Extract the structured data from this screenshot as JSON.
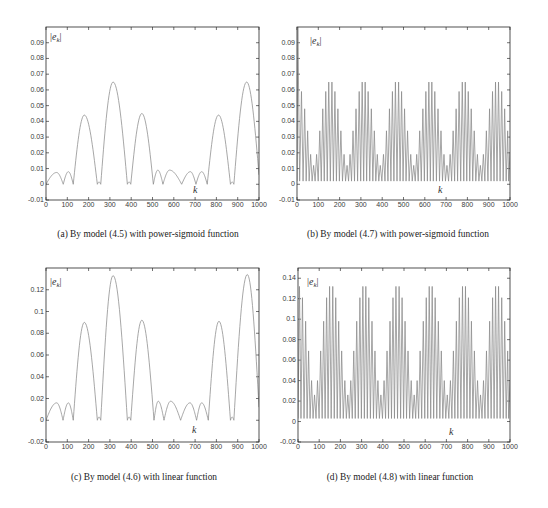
{
  "chart_data": [
    {
      "panel": "a",
      "type": "line",
      "title": "(a) By model (4.5) with power-sigmoid function",
      "xlabel": "k",
      "ylabel": "|e_k|",
      "ylabel_display": {
        "pre": "|",
        "base": "e",
        "sub": "k",
        "post": "|"
      },
      "xlim": [
        0,
        1000
      ],
      "ylim": [
        -0.01,
        0.1
      ],
      "xticks": [
        0,
        100,
        200,
        300,
        400,
        500,
        600,
        700,
        800,
        900,
        1000
      ],
      "xtick_labels": [
        "0",
        "100",
        "200",
        "300",
        "400",
        "500",
        "600",
        "700",
        "800",
        "900",
        "1000"
      ],
      "yticks": [
        -0.01,
        0,
        0.01,
        0.02,
        0.03,
        0.04,
        0.05,
        0.06,
        0.07,
        0.08,
        0.09
      ],
      "ytick_labels": [
        "-0.01",
        "0",
        "0.01",
        "0.02",
        "0.03",
        "0.04",
        "0.05",
        "0.06",
        "0.07",
        "0.08",
        "0.09"
      ],
      "grid": false,
      "legend": null,
      "line_color": "#8a8a8a",
      "render": "arcs",
      "series": [
        {
          "name": "|e_k|",
          "x": [
            0,
            50,
            81,
            105,
            128,
            180,
            241,
            249,
            257,
            315,
            382,
            390,
            398,
            450,
            504,
            525,
            549,
            580,
            637,
            678,
            704,
            731,
            757,
            810,
            866,
            874,
            882,
            942,
            1000
          ],
          "y": [
            0,
            0.0075,
            0,
            0.008,
            0,
            0.044,
            0,
            0.0015,
            0,
            0.065,
            0,
            0.0015,
            0,
            0.045,
            0,
            0.009,
            0,
            0.009,
            0,
            0.008,
            0,
            0.008,
            0,
            0.044,
            0,
            0.0015,
            0,
            0.065,
            0.006
          ]
        }
      ]
    },
    {
      "panel": "b",
      "type": "line",
      "title": "(b) By model (4.7) with power-sigmoid function",
      "xlabel": "k",
      "ylabel": "|e_k|",
      "ylabel_display": {
        "pre": "|",
        "base": "e",
        "sub": "k",
        "post": "|"
      },
      "xlim": [
        0,
        1000
      ],
      "ylim": [
        -0.01,
        0.1
      ],
      "xticks": [
        0,
        100,
        200,
        300,
        400,
        500,
        600,
        700,
        800,
        900,
        1000
      ],
      "xtick_labels": [
        "0",
        "100",
        "200",
        "300",
        "400",
        "500",
        "600",
        "700",
        "800",
        "900",
        "1000"
      ],
      "yticks": [
        -0.01,
        0,
        0.01,
        0.02,
        0.03,
        0.04,
        0.05,
        0.06,
        0.07,
        0.08,
        0.09
      ],
      "ytick_labels": [
        "-0.01",
        "0",
        "0.01",
        "0.02",
        "0.03",
        "0.04",
        "0.05",
        "0.06",
        "0.07",
        "0.08",
        "0.09"
      ],
      "grid": false,
      "legend": null,
      "line_color": "#8a8a8a",
      "render": "spikes",
      "series": [
        {
          "name": "|e_k| oscillation peaks",
          "trough": 0.002,
          "end_value": 0.02,
          "x": [
            4,
            21,
            36,
            50,
            64,
            78,
            92,
            107,
            121,
            135,
            149,
            164,
            178,
            192,
            206,
            221,
            235,
            249,
            263,
            277,
            292,
            306,
            320,
            334,
            349,
            363,
            377,
            391,
            406,
            420,
            434,
            448,
            462,
            477,
            491,
            505,
            519,
            534,
            548,
            562,
            576,
            591,
            605,
            619,
            633,
            647,
            662,
            676,
            690,
            704,
            719,
            733,
            747,
            761,
            776,
            790,
            804,
            818,
            832,
            847,
            861,
            875,
            889,
            904,
            918,
            932,
            946,
            961,
            975,
            989
          ],
          "y": [
            0.1,
            0.059,
            0.048,
            0.034,
            0.019,
            0.012,
            0.019,
            0.034,
            0.048,
            0.059,
            0.065,
            0.065,
            0.059,
            0.048,
            0.034,
            0.019,
            0.012,
            0.019,
            0.034,
            0.048,
            0.059,
            0.065,
            0.065,
            0.059,
            0.048,
            0.034,
            0.019,
            0.012,
            0.019,
            0.034,
            0.048,
            0.059,
            0.065,
            0.065,
            0.059,
            0.048,
            0.034,
            0.019,
            0.012,
            0.019,
            0.034,
            0.048,
            0.059,
            0.065,
            0.065,
            0.059,
            0.048,
            0.034,
            0.019,
            0.012,
            0.019,
            0.034,
            0.048,
            0.059,
            0.065,
            0.065,
            0.059,
            0.048,
            0.034,
            0.019,
            0.012,
            0.019,
            0.034,
            0.048,
            0.059,
            0.065,
            0.065,
            0.059,
            0.048,
            0.034
          ]
        }
      ]
    },
    {
      "panel": "c",
      "type": "line",
      "title": "(c) By model (4.6) with linear function",
      "xlabel": "k",
      "ylabel": "|e_k|",
      "ylabel_display": {
        "pre": "|",
        "base": "e",
        "sub": "k",
        "post": "|"
      },
      "xlim": [
        0,
        1000
      ],
      "ylim": [
        -0.02,
        0.14
      ],
      "xticks": [
        0,
        100,
        200,
        300,
        400,
        500,
        600,
        700,
        800,
        900,
        1000
      ],
      "xtick_labels": [
        "0",
        "100",
        "200",
        "300",
        "400",
        "500",
        "600",
        "700",
        "800",
        "900",
        "1000"
      ],
      "yticks": [
        -0.02,
        0,
        0.02,
        0.04,
        0.06,
        0.08,
        0.1,
        0.12
      ],
      "ytick_labels": [
        "-0.02",
        "0",
        "0.02",
        "0.04",
        "0.06",
        "0.08",
        "0.1",
        "0.12"
      ],
      "grid": false,
      "legend": null,
      "line_color": "#8a8a8a",
      "render": "arcs",
      "series": [
        {
          "name": "|e_k|",
          "x": [
            0,
            50,
            80,
            105,
            128,
            180,
            241,
            249,
            257,
            315,
            382,
            390,
            398,
            450,
            507,
            527,
            554,
            585,
            632,
            676,
            707,
            731,
            762,
            812,
            866,
            874,
            882,
            945,
            1000
          ],
          "y": [
            0,
            0.016,
            0,
            0.016,
            0,
            0.09,
            0,
            0.003,
            0,
            0.133,
            0,
            0.003,
            0,
            0.092,
            0,
            0.0175,
            0,
            0.0175,
            0,
            0.016,
            0,
            0.016,
            0,
            0.091,
            0,
            0.003,
            0,
            0.134,
            0.012
          ]
        }
      ]
    },
    {
      "panel": "d",
      "type": "line",
      "title": "(d) By model (4.8) with linear function",
      "xlabel": "k",
      "ylabel": "|e_k|",
      "ylabel_display": {
        "pre": "|",
        "base": "e",
        "sub": "k",
        "post": "|"
      },
      "xlim": [
        0,
        1000
      ],
      "ylim": [
        -0.02,
        0.15
      ],
      "xticks": [
        0,
        100,
        200,
        300,
        400,
        500,
        600,
        700,
        800,
        900,
        1000
      ],
      "xtick_labels": [
        "0",
        "100",
        "200",
        "300",
        "400",
        "500",
        "600",
        "700",
        "800",
        "900",
        "1000"
      ],
      "yticks": [
        -0.02,
        0,
        0.02,
        0.04,
        0.06,
        0.08,
        0.1,
        0.12,
        0.14
      ],
      "ytick_labels": [
        "-0.02",
        "0",
        "0.02",
        "0.04",
        "0.06",
        "0.08",
        "0.1",
        "0.12",
        "0.14"
      ],
      "grid": false,
      "legend": null,
      "line_color": "#8a8a8a",
      "render": "spikes",
      "series": [
        {
          "name": "|e_k| oscillation peaks",
          "trough": 0.003,
          "end_value": 0.04,
          "x": [
            7,
            21,
            36,
            50,
            64,
            78,
            92,
            107,
            121,
            135,
            149,
            164,
            178,
            192,
            206,
            221,
            235,
            249,
            263,
            277,
            292,
            306,
            320,
            334,
            349,
            363,
            377,
            391,
            406,
            420,
            434,
            448,
            462,
            477,
            491,
            505,
            519,
            534,
            548,
            562,
            576,
            591,
            605,
            619,
            633,
            647,
            662,
            676,
            690,
            704,
            719,
            733,
            747,
            761,
            776,
            790,
            804,
            818,
            832,
            847,
            861,
            875,
            889,
            904,
            918,
            932,
            946,
            961,
            975,
            989
          ],
          "y": [
            0.132,
            0.121,
            0.098,
            0.069,
            0.04,
            0.026,
            0.04,
            0.069,
            0.098,
            0.121,
            0.132,
            0.132,
            0.121,
            0.098,
            0.069,
            0.04,
            0.026,
            0.04,
            0.069,
            0.098,
            0.121,
            0.132,
            0.132,
            0.121,
            0.098,
            0.069,
            0.04,
            0.026,
            0.04,
            0.069,
            0.098,
            0.121,
            0.132,
            0.132,
            0.121,
            0.098,
            0.069,
            0.04,
            0.026,
            0.04,
            0.069,
            0.098,
            0.121,
            0.132,
            0.132,
            0.121,
            0.098,
            0.069,
            0.04,
            0.026,
            0.04,
            0.069,
            0.098,
            0.121,
            0.132,
            0.132,
            0.121,
            0.098,
            0.069,
            0.04,
            0.026,
            0.04,
            0.069,
            0.098,
            0.121,
            0.132,
            0.132,
            0.121,
            0.098,
            0.069
          ]
        }
      ]
    }
  ]
}
